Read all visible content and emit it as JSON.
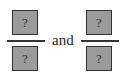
{
  "fractions": [
    {
      "numerator": "?",
      "denominator": "?"
    },
    {
      "numerator": "?",
      "denominator": "?"
    }
  ],
  "connector": "and",
  "colors": {
    "box_fill": "#9b9b9b",
    "box_border": "#333333",
    "line": "#333333"
  }
}
